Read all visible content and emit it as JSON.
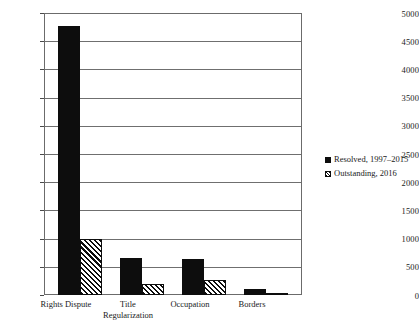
{
  "chart_data": {
    "type": "bar",
    "title": "",
    "subtitle": "",
    "xlabel": "",
    "ylabel": "",
    "categories": [
      "Rights Dispute",
      "Title Regularization",
      "Occupation",
      "Borders"
    ],
    "category_lines": [
      [
        "Rights Dispute"
      ],
      [
        "Title",
        "Regularization"
      ],
      [
        "Occupation"
      ],
      [
        "Borders"
      ]
    ],
    "series": [
      {
        "name": "Resolved, 1997–2015",
        "fill": "solid",
        "color": "#0d0d0d",
        "values": [
          4770,
          660,
          640,
          110
        ]
      },
      {
        "name": "Outstanding, 2016",
        "fill": "hatched",
        "color": "#0d0d0d",
        "values": [
          1000,
          195,
          270,
          35
        ]
      }
    ],
    "ylim": [
      0,
      5000
    ],
    "yticks": [
      0,
      500,
      1000,
      1500,
      2000,
      2500,
      3000,
      3500,
      4000,
      4500,
      5000
    ],
    "ytick_labels": [
      "0",
      "500",
      "1000",
      "1500",
      "2000",
      "2500",
      "3000",
      "3500",
      "4000",
      "4500",
      "5000"
    ],
    "grid": true,
    "grid_axis": "y",
    "legend_position": "right",
    "frame": true
  },
  "legend": {
    "entries": [
      {
        "label": "Resolved, 1997–2015",
        "marker": "solid-square-icon"
      },
      {
        "label": "Outstanding, 2016",
        "marker": "hatched-square-icon"
      }
    ]
  }
}
